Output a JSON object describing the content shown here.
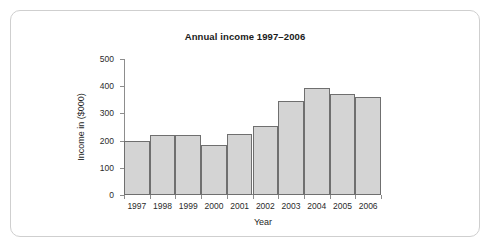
{
  "chart_data": {
    "type": "bar",
    "title": "Annual income 1997–2006",
    "xlabel": "Year",
    "ylabel": "Income in ($000)",
    "categories": [
      "1997",
      "1998",
      "1999",
      "2000",
      "2001",
      "2002",
      "2003",
      "2004",
      "2005",
      "2006"
    ],
    "values": [
      200,
      222,
      222,
      185,
      225,
      252,
      346,
      394,
      373,
      360
    ],
    "ylim": [
      0,
      500
    ],
    "ytick_labels": [
      "0",
      "100",
      "200",
      "300",
      "400",
      "500"
    ],
    "yticks": [
      0,
      100,
      200,
      300,
      400,
      500
    ],
    "grid": false,
    "legend": "none",
    "bar_fill_color": "#d4d4d4",
    "bar_border_color": "#6f6f6f",
    "axis_color": "#8d8d8d",
    "card_border_color": "#cfcfcf",
    "background_color": "#ffffff"
  }
}
